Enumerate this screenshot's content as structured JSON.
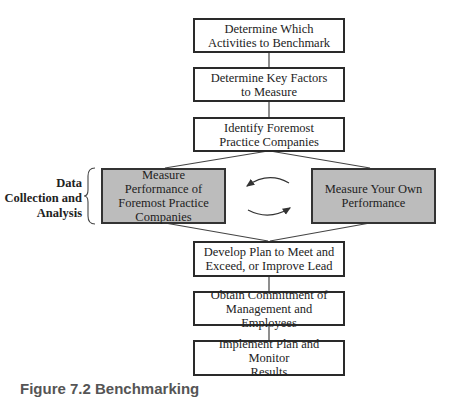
{
  "diagram": {
    "type": "flowchart",
    "steps": [
      {
        "id": "s1",
        "label": "Determine Which\nActivities to Benchmark"
      },
      {
        "id": "s2",
        "label": "Determine Key Factors\nto Measure"
      },
      {
        "id": "s3",
        "label": "Identify Foremost\nPractice Companies"
      },
      {
        "id": "s4a",
        "label": "Measure\nPerformance of\nForemost Practice\nCompanies",
        "highlighted": true
      },
      {
        "id": "s4b",
        "label": "Measure Your Own\nPerformance",
        "highlighted": true
      },
      {
        "id": "s5",
        "label": "Develop Plan to Meet and\nExceed, or Improve Lead"
      },
      {
        "id": "s6",
        "label": "Obtain Commitment of\nManagement and Employees"
      },
      {
        "id": "s7",
        "label": "Implement Plan and Monitor\nResults"
      }
    ],
    "group_label": "Data\nCollection and\nAnalysis",
    "edges": [
      [
        "s1",
        "s2"
      ],
      [
        "s2",
        "s3"
      ],
      [
        "s3",
        "s4a"
      ],
      [
        "s3",
        "s4b"
      ],
      [
        "s4a",
        "s4b"
      ],
      [
        "s4b",
        "s4a"
      ],
      [
        "s4a",
        "s5"
      ],
      [
        "s4b",
        "s5"
      ],
      [
        "s5",
        "s6"
      ],
      [
        "s6",
        "s7"
      ]
    ],
    "caption": "Figure 7.2  Benchmarking",
    "colors": {
      "highlight_fill": "#bcbcbc",
      "border": "#2a2a2a",
      "background": "#ffffff"
    }
  }
}
